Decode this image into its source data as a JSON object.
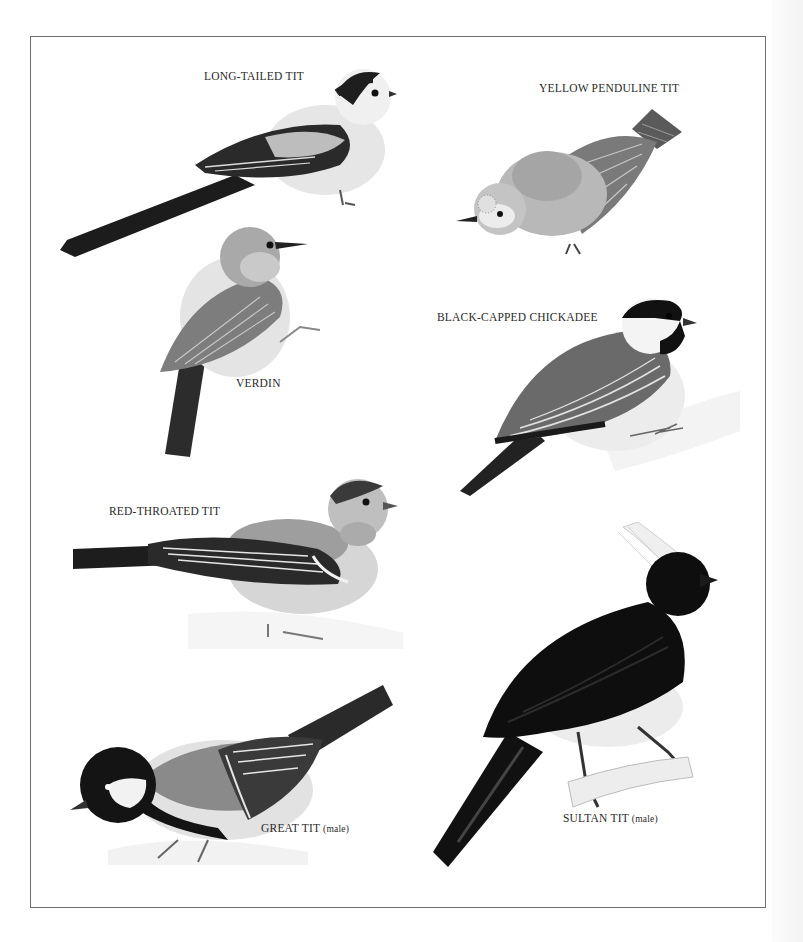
{
  "plate": {
    "border_color": "#6e6e6e",
    "species": [
      {
        "id": "long-tailed-tit",
        "name": "LONG-TAILED TIT",
        "qualifier": ""
      },
      {
        "id": "yellow-penduline-tit",
        "name": "YELLOW PENDULINE TIT",
        "qualifier": ""
      },
      {
        "id": "verdin",
        "name": "VERDIN",
        "qualifier": ""
      },
      {
        "id": "black-capped-chickadee",
        "name": "BLACK-CAPPED CHICKADEE",
        "qualifier": ""
      },
      {
        "id": "red-throated-tit",
        "name": "RED-THROATED TIT",
        "qualifier": ""
      },
      {
        "id": "great-tit",
        "name": "GREAT TIT",
        "qualifier": "(male)"
      },
      {
        "id": "sultan-tit",
        "name": "SULTAN TIT",
        "qualifier": "(male)"
      }
    ]
  }
}
